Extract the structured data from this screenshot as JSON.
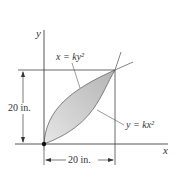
{
  "figure": {
    "axes": {
      "x_label": "x",
      "y_label": "y"
    },
    "curves": [
      {
        "id": "upper",
        "label": "x = ky²",
        "equation": "x=ky^2"
      },
      {
        "id": "lower",
        "label": "y = kx²",
        "equation": "y=kx^2"
      }
    ],
    "dimensions": {
      "height": "20 in.",
      "width": "20 in."
    },
    "colors": {
      "fill": "#c8c8c8",
      "line": "#555555",
      "axis": "#444444"
    }
  }
}
